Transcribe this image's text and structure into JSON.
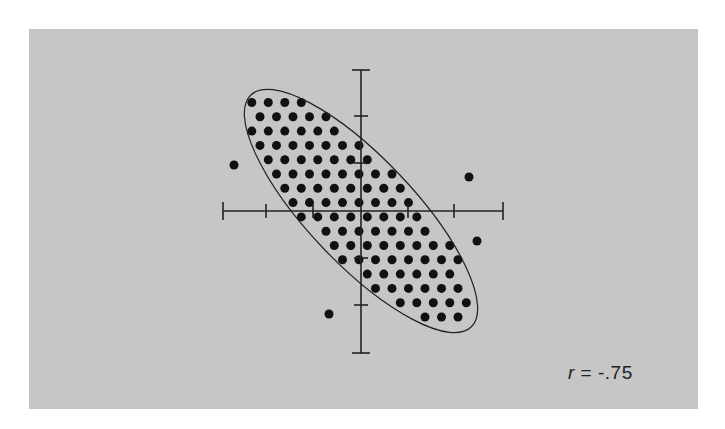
{
  "figure": {
    "background_color": "#c6c6c6",
    "ink_color": "#111111",
    "label": {
      "variable": "r",
      "equals": " = ",
      "value": "-.75"
    }
  },
  "chart_data": {
    "type": "scatter",
    "title": "",
    "annotation": "r = -.75",
    "correlation": -0.75,
    "xlabel": "",
    "ylabel": "",
    "grid": false,
    "legend": null,
    "axes": {
      "origin_px": [
        361,
        211
      ],
      "x_axis_px": [
        223,
        503
      ],
      "y_axis_px": [
        70,
        353
      ],
      "tick_spacing_px": 47,
      "x_ticks_px": [
        266,
        313,
        408,
        454
      ],
      "y_ticks_px": [
        116,
        163,
        258,
        305
      ],
      "tick_labels": []
    },
    "ellipse": {
      "center_px": [
        361,
        211
      ],
      "semi_major_px": 160,
      "semi_minor_px": 53,
      "rotation_deg": 46.5,
      "outline": "thin solid",
      "fill": "dense uniform lattice of dots"
    },
    "dot_lattice": {
      "spacing_px": 16.5,
      "row_height_px": 14.3,
      "dot_radius_px": 4.5
    },
    "outliers_px": [
      {
        "x": 234,
        "y": 165
      },
      {
        "x": 469,
        "y": 177
      },
      {
        "x": 477,
        "y": 241
      },
      {
        "x": 329,
        "y": 314
      }
    ]
  }
}
